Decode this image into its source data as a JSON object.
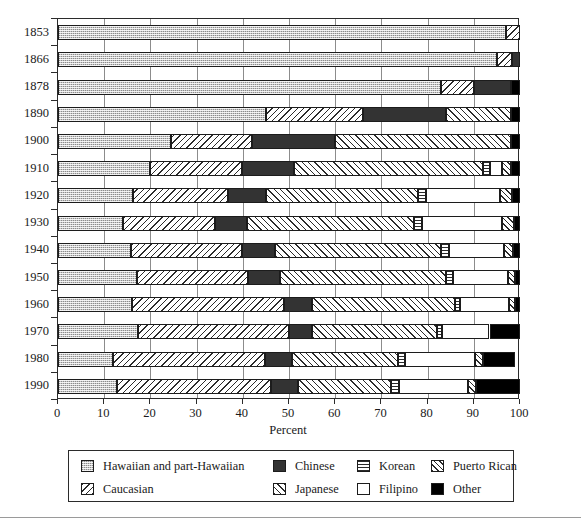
{
  "chart_data": {
    "type": "bar",
    "orientation": "horizontal",
    "stacked": true,
    "title": "",
    "xlabel": "Percent",
    "ylabel": "",
    "xlim": [
      0,
      100
    ],
    "xticks": [
      0,
      10,
      20,
      30,
      40,
      50,
      60,
      70,
      80,
      90,
      100
    ],
    "grid": true,
    "grid_axis": "x",
    "legend_position": "bottom",
    "categories": [
      "1853",
      "1866",
      "1878",
      "1890",
      "1900",
      "1910",
      "1920",
      "1930",
      "1940",
      "1950",
      "1960",
      "1970",
      "1980",
      "1990"
    ],
    "series": [
      {
        "name": "Hawaiian and part-Hawaiian",
        "pattern": "hawaiian",
        "values": [
          97.0,
          95.0,
          83.0,
          45.0,
          24.5,
          20.0,
          16.3,
          14.0,
          15.8,
          17.0,
          16.0,
          17.3,
          11.8,
          12.8
        ]
      },
      {
        "name": "Caucasian",
        "pattern": "caucasian",
        "values": [
          3.0,
          3.2,
          7.0,
          21.0,
          17.5,
          19.8,
          20.5,
          20.0,
          24.0,
          24.2,
          33.0,
          32.7,
          33.0,
          33.2
        ]
      },
      {
        "name": "Chinese",
        "pattern": "chinese",
        "values": [
          0.0,
          1.8,
          8.0,
          18.0,
          18.0,
          11.2,
          8.2,
          7.0,
          7.2,
          6.8,
          6.0,
          5.0,
          5.8,
          6.0
        ]
      },
      {
        "name": "Japanese",
        "pattern": "japanese",
        "values": [
          0.0,
          0.0,
          0.0,
          14.0,
          38.0,
          41.0,
          33.0,
          36.0,
          36.0,
          36.0,
          31.0,
          27.0,
          23.0,
          20.0
        ]
      },
      {
        "name": "Korean",
        "pattern": "korean",
        "values": [
          0.0,
          0.0,
          0.0,
          0.0,
          0.0,
          1.5,
          1.7,
          1.7,
          1.6,
          1.4,
          1.1,
          1.2,
          1.6,
          1.8
        ]
      },
      {
        "name": "Filipino",
        "pattern": "filipino",
        "values": [
          0.0,
          0.0,
          0.0,
          0.0,
          0.0,
          2.5,
          16.0,
          17.5,
          12.0,
          12.0,
          10.5,
          10.2,
          15.0,
          15.0
        ]
      },
      {
        "name": "Puerto Rican",
        "pattern": "puertorican",
        "values": [
          0.0,
          0.0,
          0.0,
          0.0,
          0.0,
          2.0,
          2.5,
          2.5,
          1.8,
          1.6,
          1.4,
          0.0,
          1.8,
          1.7
        ]
      },
      {
        "name": "Other",
        "pattern": "other",
        "values": [
          0.0,
          0.0,
          2.0,
          2.0,
          2.0,
          2.0,
          1.8,
          1.3,
          1.6,
          1.0,
          1.0,
          6.6,
          7.0,
          9.5
        ]
      }
    ]
  },
  "axis": {
    "x_title": "Percent",
    "x_tick_labels": [
      "0",
      "10",
      "20",
      "30",
      "40",
      "50",
      "60",
      "70",
      "80",
      "90",
      "100"
    ],
    "y_tick_labels": [
      "1853",
      "1866",
      "1878",
      "1890",
      "1900",
      "1910",
      "1920",
      "1930",
      "1940",
      "1950",
      "1960",
      "1970",
      "1980",
      "1990"
    ]
  },
  "legend": {
    "entries": [
      {
        "label": "Hawaiian and part-Hawaiian",
        "pattern": "hawaiian",
        "row": 0,
        "col": 0
      },
      {
        "label": "Chinese",
        "pattern": "chinese",
        "row": 0,
        "col": 1
      },
      {
        "label": "Korean",
        "pattern": "korean",
        "row": 0,
        "col": 2
      },
      {
        "label": "Puerto Rican",
        "pattern": "puertorican",
        "row": 0,
        "col": 3
      },
      {
        "label": "Caucasian",
        "pattern": "caucasian",
        "row": 1,
        "col": 0
      },
      {
        "label": "Japanese",
        "pattern": "japanese",
        "row": 1,
        "col": 1
      },
      {
        "label": "Filipino",
        "pattern": "filipino",
        "row": 1,
        "col": 2
      },
      {
        "label": "Other",
        "pattern": "other",
        "row": 1,
        "col": 3
      }
    ]
  },
  "colors": {
    "ink": "#1a1a1a",
    "frame": "#2b2b2b",
    "grid": "#8c8c8c",
    "hawaiian": "#c9c9c9",
    "chinese": "#333333",
    "other": "#000000",
    "background": "#ffffff"
  }
}
